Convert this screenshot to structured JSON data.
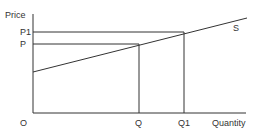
{
  "diagram": {
    "axes": {
      "y_label": "Price",
      "x_label": "Quantity",
      "origin_label": "O"
    },
    "price_levels": [
      {
        "label": "P1",
        "y": 32
      },
      {
        "label": "P",
        "y": 44
      }
    ],
    "quantity_levels": [
      {
        "label": "Q",
        "x": 139
      },
      {
        "label": "Q1",
        "x": 184
      }
    ],
    "curve": {
      "label": "S",
      "type": "supply"
    },
    "line_color": "#333333"
  }
}
